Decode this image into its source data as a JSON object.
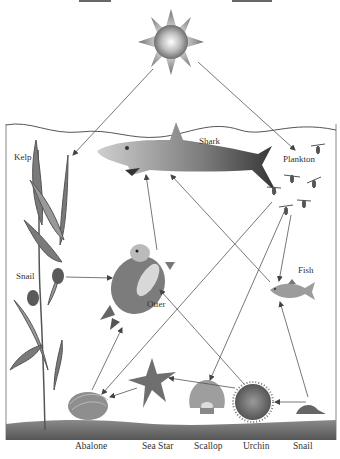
{
  "diagram": {
    "type": "food-web",
    "sun": {
      "label": ""
    },
    "organisms": [
      {
        "id": "kelp",
        "label": "Kelp"
      },
      {
        "id": "shark",
        "label": "Shark"
      },
      {
        "id": "plankton",
        "label": "Plankton"
      },
      {
        "id": "snail_kelp",
        "label": "Snail"
      },
      {
        "id": "otter",
        "label": "Otter"
      },
      {
        "id": "fish",
        "label": "Fish"
      },
      {
        "id": "abalone",
        "label": "Abalone"
      },
      {
        "id": "seastar",
        "label": "Sea Star"
      },
      {
        "id": "scallop",
        "label": "Scallop"
      },
      {
        "id": "urchin",
        "label": "Urchin"
      },
      {
        "id": "snail_floor",
        "label": "Snail"
      }
    ],
    "arrows": [
      {
        "from": "sun",
        "to": "kelp"
      },
      {
        "from": "sun",
        "to": "plankton"
      },
      {
        "from": "otter",
        "to": "shark"
      },
      {
        "from": "fish",
        "to": "shark"
      },
      {
        "from": "plankton",
        "to": "fish"
      },
      {
        "from": "plankton",
        "to": "abalone"
      },
      {
        "from": "plankton",
        "to": "scallop"
      },
      {
        "from": "snail_kelp",
        "to": "otter"
      },
      {
        "from": "abalone",
        "to": "otter"
      },
      {
        "from": "urchin",
        "to": "otter"
      },
      {
        "from": "seastar",
        "to": "abalone"
      },
      {
        "from": "urchin",
        "to": "seastar"
      },
      {
        "from": "snail_floor",
        "to": "urchin"
      },
      {
        "from": "snail_floor",
        "to": "fish"
      }
    ],
    "colors": {
      "water_line": "#555555",
      "seabed": "#6e6e6e",
      "arrow": "#555555",
      "border": "#888888"
    }
  }
}
